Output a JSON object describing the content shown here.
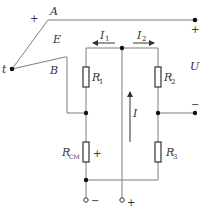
{
  "diagram": {
    "type": "circuit",
    "colors": {
      "wire": "#7f7f7f",
      "ink": "#333333",
      "node": "#111111"
    },
    "labels": {
      "junction": "t",
      "wire_a": "A",
      "wire_b": "B",
      "emf": "E",
      "plus_a": "+",
      "current_1": "I",
      "current_1_sub": "1",
      "current_2": "I",
      "current_2_sub": "2",
      "current_total": "I",
      "r1": "R",
      "r1_sub": "1",
      "r2": "R",
      "r2_sub": "2",
      "r3": "R",
      "r3_sub": "3",
      "rcm": "R",
      "rcm_sub": "CM",
      "rcm_plus": "+",
      "output_voltage": "U",
      "output_plus": "+",
      "output_minus": "−",
      "supply_minus": "−",
      "supply_plus": "+"
    }
  }
}
